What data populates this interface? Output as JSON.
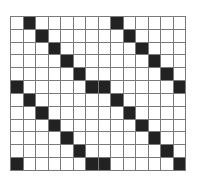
{
  "grid": {
    "columns": 14,
    "rows": 12,
    "filled_color": "#222222",
    "empty_color": "#ffffff",
    "line_color": "#7a7a7a",
    "filled_cells": [
      [
        0,
        1
      ],
      [
        0,
        8
      ],
      [
        1,
        2
      ],
      [
        1,
        9
      ],
      [
        2,
        3
      ],
      [
        2,
        10
      ],
      [
        3,
        4
      ],
      [
        3,
        11
      ],
      [
        4,
        5
      ],
      [
        4,
        12
      ],
      [
        5,
        0
      ],
      [
        5,
        6
      ],
      [
        5,
        7
      ],
      [
        5,
        13
      ],
      [
        6,
        1
      ],
      [
        6,
        8
      ],
      [
        7,
        2
      ],
      [
        7,
        9
      ],
      [
        8,
        3
      ],
      [
        8,
        10
      ],
      [
        9,
        4
      ],
      [
        9,
        11
      ],
      [
        10,
        5
      ],
      [
        10,
        12
      ],
      [
        11,
        0
      ],
      [
        11,
        6
      ],
      [
        11,
        7
      ],
      [
        11,
        13
      ]
    ]
  }
}
